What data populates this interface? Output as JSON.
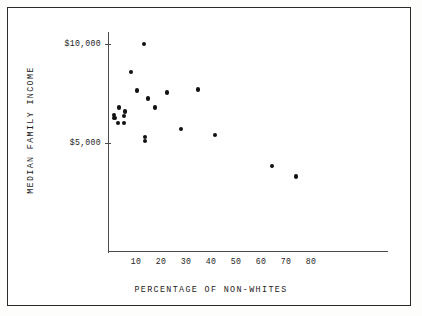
{
  "figure": {
    "background_color": "#ffffff",
    "border_color": "#2b2b2b",
    "axis_color": "#4a4a4a",
    "point_color": "#111111"
  },
  "chart_data": {
    "type": "scatter",
    "title": "",
    "xlabel": "PERCENTAGE OF NON-WHITES",
    "ylabel": "MEDIAN FAMILY INCOME",
    "xlim": [
      0,
      88
    ],
    "ylim": [
      2000,
      10600
    ],
    "grid": false,
    "legend": null,
    "xticks": [
      10,
      20,
      30,
      40,
      50,
      60,
      70,
      80
    ],
    "xticklabels": [
      "10",
      "20",
      "30",
      "40",
      "50",
      "60",
      "70",
      "80"
    ],
    "yticks": [
      5000,
      10000
    ],
    "yticklabels": [
      "$5,000",
      "$10,000"
    ],
    "points": [
      {
        "x": 13.2,
        "y": 10000
      },
      {
        "x": 8.0,
        "y": 8600
      },
      {
        "x": 10.4,
        "y": 7650
      },
      {
        "x": 22.4,
        "y": 7550
      },
      {
        "x": 34.8,
        "y": 7700
      },
      {
        "x": 14.8,
        "y": 7250
      },
      {
        "x": 3.2,
        "y": 6800
      },
      {
        "x": 17.6,
        "y": 6800
      },
      {
        "x": 5.6,
        "y": 6600
      },
      {
        "x": 1.2,
        "y": 6400
      },
      {
        "x": 1.4,
        "y": 6250
      },
      {
        "x": 5.2,
        "y": 6350
      },
      {
        "x": 2.8,
        "y": 6000
      },
      {
        "x": 5.2,
        "y": 6000
      },
      {
        "x": 28.0,
        "y": 5700
      },
      {
        "x": 41.6,
        "y": 5400
      },
      {
        "x": 13.6,
        "y": 5300
      },
      {
        "x": 13.6,
        "y": 5100
      },
      {
        "x": 64.4,
        "y": 3850
      },
      {
        "x": 74.0,
        "y": 3300
      }
    ]
  }
}
